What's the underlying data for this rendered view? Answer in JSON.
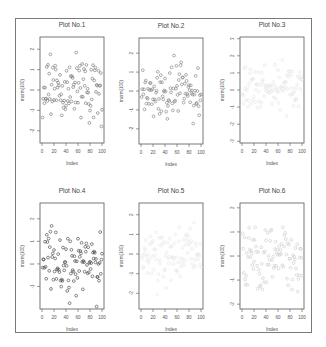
{
  "figure": {
    "layout": "2x3 grid of scatter plots",
    "frame_color": "#7a7a7a"
  },
  "chart_data": [
    {
      "type": "scatter",
      "title": "Plot No.1",
      "xlabel": "Index",
      "ylabel": "rnorm(100)",
      "xticks": [
        "0",
        "20",
        "40",
        "60",
        "80",
        "100"
      ],
      "yticks": [
        "2",
        "1",
        "0",
        "-1",
        "-2"
      ],
      "xlim": [
        0,
        100
      ],
      "ylim": [
        -2.6,
        2.6
      ],
      "point_color": "#6e6e6e",
      "n_points": 100
    },
    {
      "type": "scatter",
      "title": "Plot No.2",
      "xlabel": "Index",
      "ylabel": "rnorm(100)",
      "xticks": [
        "0",
        "20",
        "40",
        "60",
        "80",
        "100"
      ],
      "yticks": [
        "2",
        "1",
        "0",
        "-1",
        "-2"
      ],
      "xlim": [
        0,
        100
      ],
      "ylim": [
        -2.8,
        2.8
      ],
      "point_color": "#7a7a7a",
      "n_points": 100
    },
    {
      "type": "scatter",
      "title": "Plot No.3",
      "xlabel": "Index",
      "ylabel": "rnorm(100)",
      "xticks": [
        "0",
        "20",
        "40",
        "60",
        "80",
        "100"
      ],
      "yticks": [
        "3",
        "2",
        "1",
        "0",
        "-1",
        "-2",
        "-3"
      ],
      "xlim": [
        0,
        100
      ],
      "ylim": [
        -3.1,
        3.1
      ],
      "point_color": "#e2e2e2",
      "n_points": 100
    },
    {
      "type": "scatter",
      "title": "Plot No.4",
      "xlabel": "Index",
      "ylabel": "rnorm(100)",
      "xticks": [
        "0",
        "20",
        "40",
        "60",
        "80",
        "100"
      ],
      "yticks": [
        "2",
        "1",
        "0",
        "-1"
      ],
      "xlim": [
        0,
        100
      ],
      "ylim": [
        -2.0,
        2.7
      ],
      "point_color": "#3a3a3a",
      "n_points": 100
    },
    {
      "type": "scatter",
      "title": "Plot No.5",
      "xlabel": "Index",
      "ylabel": "rnorm(100)",
      "xticks": [
        "0",
        "20",
        "40",
        "60",
        "80",
        "100"
      ],
      "yticks": [
        "2",
        "1",
        "0",
        "-1",
        "-2"
      ],
      "xlim": [
        0,
        100
      ],
      "ylim": [
        -2.8,
        2.6
      ],
      "point_color": "#e4e4e4",
      "n_points": 100
    },
    {
      "type": "scatter",
      "title": "Plot No.6",
      "xlabel": "Index",
      "ylabel": "rnorm(100)",
      "xticks": [
        "0",
        "20",
        "40",
        "60",
        "80",
        "100"
      ],
      "yticks": [
        "2",
        "1",
        "0",
        "-1",
        "-2"
      ],
      "xlim": [
        0,
        100
      ],
      "ylim": [
        -2.2,
        2.2
      ],
      "point_color": "#c9c9c9",
      "n_points": 100
    }
  ]
}
